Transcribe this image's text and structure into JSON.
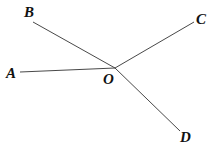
{
  "diagram": {
    "type": "geometry-rays",
    "vertex": {
      "label": "O",
      "x": 115,
      "y": 68,
      "label_x": 103,
      "label_y": 84
    },
    "rays": [
      {
        "id": "OA",
        "end_label": "A",
        "x": 20,
        "y": 72,
        "label_x": 6,
        "label_y": 78
      },
      {
        "id": "OB",
        "end_label": "B",
        "x": 33,
        "y": 22,
        "label_x": 24,
        "label_y": 17
      },
      {
        "id": "OC",
        "end_label": "C",
        "x": 194,
        "y": 22,
        "label_x": 196,
        "label_y": 24
      },
      {
        "id": "OD",
        "end_label": "D",
        "x": 180,
        "y": 131,
        "label_x": 180,
        "label_y": 142
      }
    ],
    "colors": {
      "line": "#333333",
      "text": "#111111",
      "background": "#ffffff"
    }
  }
}
